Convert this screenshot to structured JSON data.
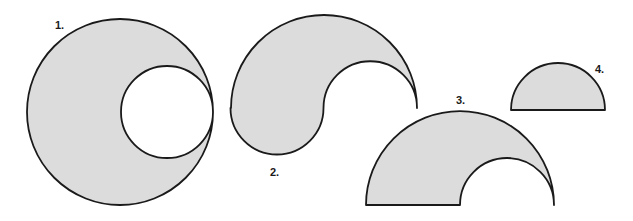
{
  "colors": {
    "fill": "#dcdcdc",
    "stroke": "#1a1a1a",
    "background": "#ffffff"
  },
  "figures": [
    {
      "id": 1,
      "label": "1.",
      "label_pos": {
        "x": 55,
        "y": 29
      },
      "description": "large circle with an internally tangent smaller circular hole touching the right edge",
      "outer": {
        "cx": 120,
        "cy": 112,
        "r": 93
      },
      "hole": {
        "cx": 167,
        "cy": 112,
        "r": 46
      }
    },
    {
      "id": 2,
      "label": "2.",
      "label_pos": {
        "x": 270,
        "y": 176
      },
      "description": "S-shaped region: large upper semicircle minus small upper semicircle on the right plus small lower semicircle on the left",
      "large": {
        "cx": 324,
        "cy": 108,
        "r": 93
      },
      "small_right": {
        "cx": 370,
        "cy": 108,
        "r": 46.5
      },
      "small_left": {
        "cx": 277,
        "cy": 108,
        "r": 46.5
      }
    },
    {
      "id": 3,
      "label": "3.",
      "label_pos": {
        "x": 456,
        "y": 104
      },
      "description": "large semicircle with a smaller semicircle cut out at the right end of the diameter",
      "outer": {
        "cx": 460,
        "cy": 205,
        "r": 94
      },
      "cutout": {
        "cx": 507,
        "cy": 205,
        "r": 47
      }
    },
    {
      "id": 4,
      "label": "4.",
      "label_pos": {
        "x": 595,
        "y": 73
      },
      "description": "small semicircle",
      "semicircle": {
        "cx": 558,
        "cy": 110,
        "r": 47
      }
    }
  ]
}
